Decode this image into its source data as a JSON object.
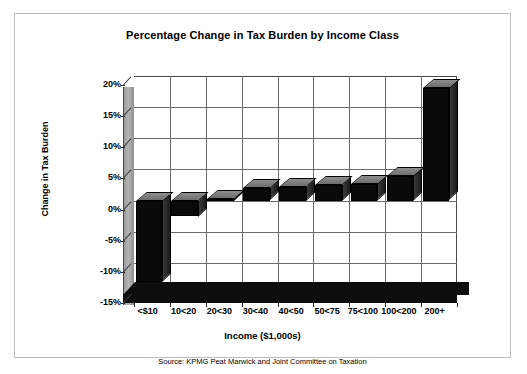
{
  "chart_data": {
    "type": "bar",
    "title": "Percentage Change in Tax Burden by Income Class",
    "xlabel": "Income ($1,000s)",
    "ylabel": "Change in Tax Burden",
    "categories": [
      "<$10",
      "10<20",
      "20<30",
      "30<40",
      "40<50",
      "50<75",
      "75<100",
      "100<200",
      "200+"
    ],
    "values": [
      -13,
      -2.5,
      0.3,
      2,
      2.2,
      2.5,
      2.7,
      4,
      18
    ],
    "ylim": [
      -15,
      20
    ],
    "ytick_labels": [
      "20%",
      "15%",
      "10%",
      "5%",
      "0%",
      "-5%",
      "-10%",
      "-15%"
    ],
    "ytick_values": [
      20,
      15,
      10,
      5,
      0,
      -5,
      -10,
      -15
    ],
    "grid": true,
    "legend": "none",
    "style": "3d-bar",
    "annotation": "Source:  KPMG Peat Marwick and Joint Committee on Taxation",
    "colors": {
      "bar_front": "#0a0a0a",
      "bar_top": "#7d7d7d",
      "grid": "#6b6b6b",
      "wall": "#ffffff",
      "side_wall": "#a8a8a8",
      "frame_border": "#bdbdbd",
      "text": "#000000"
    }
  }
}
